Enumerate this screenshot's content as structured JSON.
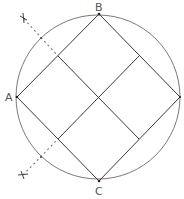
{
  "diagram": {
    "labels": {
      "A": "A",
      "B": "B",
      "C": "C"
    },
    "marks": {
      "top_cross": "×",
      "bottom_cross": "×"
    },
    "colors": {
      "line": "#3a3a3a",
      "circle": "#7a7a7a",
      "label": "#555555"
    }
  }
}
